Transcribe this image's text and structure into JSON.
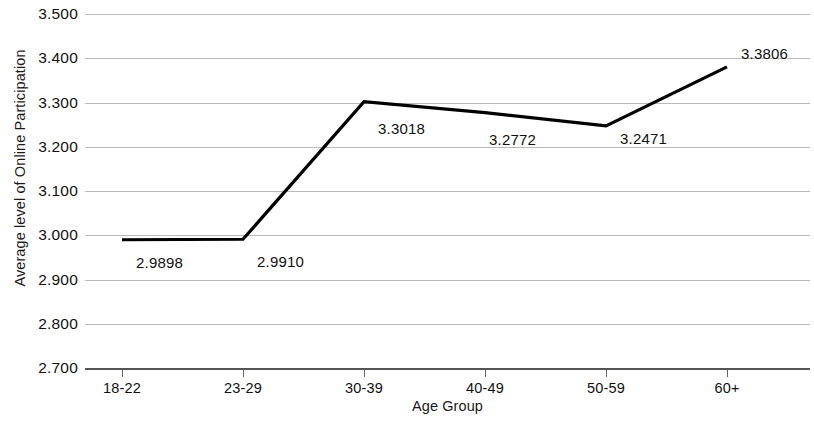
{
  "chart_data": {
    "type": "line",
    "title": "",
    "xlabel": "Age Group",
    "ylabel": "Average level of Online Participation",
    "categories": [
      "18-22",
      "23-29",
      "30-39",
      "40-49",
      "50-59",
      "60+"
    ],
    "values": [
      2.9898,
      2.991,
      3.3018,
      3.2772,
      3.2471,
      3.3806
    ],
    "point_labels": [
      "2.9898",
      "2.9910",
      "3.3018",
      "3.2772",
      "3.2471",
      "3.3806"
    ],
    "ylim": [
      2.7,
      3.5
    ],
    "ytick_labels": [
      "3.500",
      "3.400",
      "3.300",
      "3.200",
      "3.100",
      "3.000",
      "2.900",
      "2.800",
      "2.700"
    ],
    "ytick_values": [
      3.5,
      3.4,
      3.3,
      3.2,
      3.1,
      3.0,
      2.9,
      2.8,
      2.7
    ],
    "grid": true,
    "legend": false,
    "series_color": "#000000",
    "grid_color": "#b9b9b9",
    "axis_color": "#555555",
    "background": "#ffffff"
  }
}
